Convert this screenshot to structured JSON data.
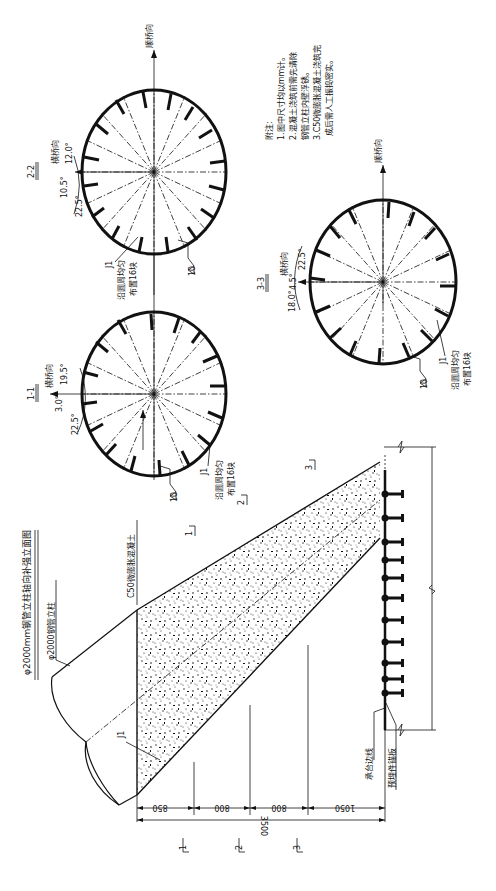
{
  "drawing": {
    "title": "φ2000mm钢管立柱轴向补强立面图",
    "column_label": "φ2000钢管立柱",
    "concrete_label": "C50微膨胀混凝土",
    "j1_label": "J1",
    "cap_edge_label": "承台边线",
    "anchor_plate_label": "预埋件锚板",
    "section_marks": [
      "1",
      "2",
      "3"
    ],
    "dimensions": {
      "segments": [
        "850",
        "800",
        "800",
        "1050"
      ],
      "total": "3500"
    }
  },
  "sections": [
    {
      "id": "1-1",
      "title": "1-1",
      "transverse_label": "横桥向",
      "angles": [
        "19.5°",
        "3.0°",
        "22.5°"
      ],
      "j1_label": "J1",
      "distribution_note_line1": "沿圆周均匀",
      "distribution_note_line2": "布置16块",
      "weld_size": "10"
    },
    {
      "id": "2-2",
      "title": "2-2",
      "transverse_label": "横桥向",
      "longitudinal_label": "顺桥向",
      "angles": [
        "12.0°",
        "10.5°",
        "22.5°"
      ],
      "j1_label": "J1",
      "distribution_note_line1": "沿圆周均匀",
      "distribution_note_line2": "布置16块",
      "weld_size": "10"
    },
    {
      "id": "3-3",
      "title": "3-3",
      "transverse_label": "横桥向",
      "longitudinal_label": "顺桥向",
      "angles": [
        "4.5°",
        "22.5°",
        "18.0°"
      ],
      "j1_label": "J1",
      "distribution_note_line1": "沿圆周均匀",
      "distribution_note_line2": "布置16块",
      "weld_size": "10"
    }
  ],
  "notes": {
    "heading": "附注:",
    "items": [
      "1.图中尺寸均以mm计。",
      "2.混凝土浇筑前需先清除",
      "钢管立柱内壁浮锈。",
      "3.C50微膨胀混凝土浇筑完",
      "成后需人工振捣密实。"
    ]
  }
}
